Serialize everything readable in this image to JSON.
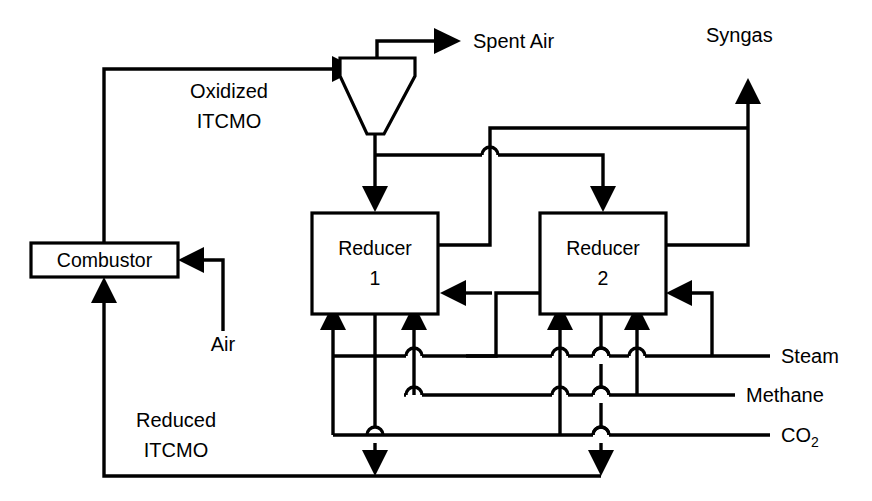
{
  "diagram": {
    "units": [
      {
        "id": "combustor",
        "label": "Combustor"
      },
      {
        "id": "cyclone",
        "label": ""
      },
      {
        "id": "reducer1",
        "label_line1": "Reducer",
        "label_line2": "1"
      },
      {
        "id": "reducer2",
        "label_line1": "Reducer",
        "label_line2": "2"
      }
    ],
    "streams": [
      {
        "id": "spent-air",
        "label": "Spent Air"
      },
      {
        "id": "syngas",
        "label": "Syngas"
      },
      {
        "id": "oxidized-itcmo",
        "label_line1": "Oxidized",
        "label_line2": "ITCMO"
      },
      {
        "id": "reduced-itcmo",
        "label_line1": "Reduced",
        "label_line2": "ITCMO"
      },
      {
        "id": "air",
        "label": "Air"
      },
      {
        "id": "steam",
        "label": "Steam"
      },
      {
        "id": "methane",
        "label": "Methane"
      },
      {
        "id": "co2",
        "label": "CO",
        "subscript": "2"
      }
    ],
    "colors": {
      "line": "#000000",
      "background": "#ffffff",
      "text": "#000000"
    }
  }
}
